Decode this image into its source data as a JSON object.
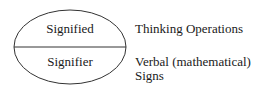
{
  "diagram": {
    "ellipse": {
      "top_label": "Signified",
      "bottom_label": "Signifier",
      "stroke_color": "#333333"
    },
    "annotations": {
      "top": "Thinking Operations",
      "bottom_line1": "Verbal (mathematical)",
      "bottom_line2": "Signs"
    }
  }
}
